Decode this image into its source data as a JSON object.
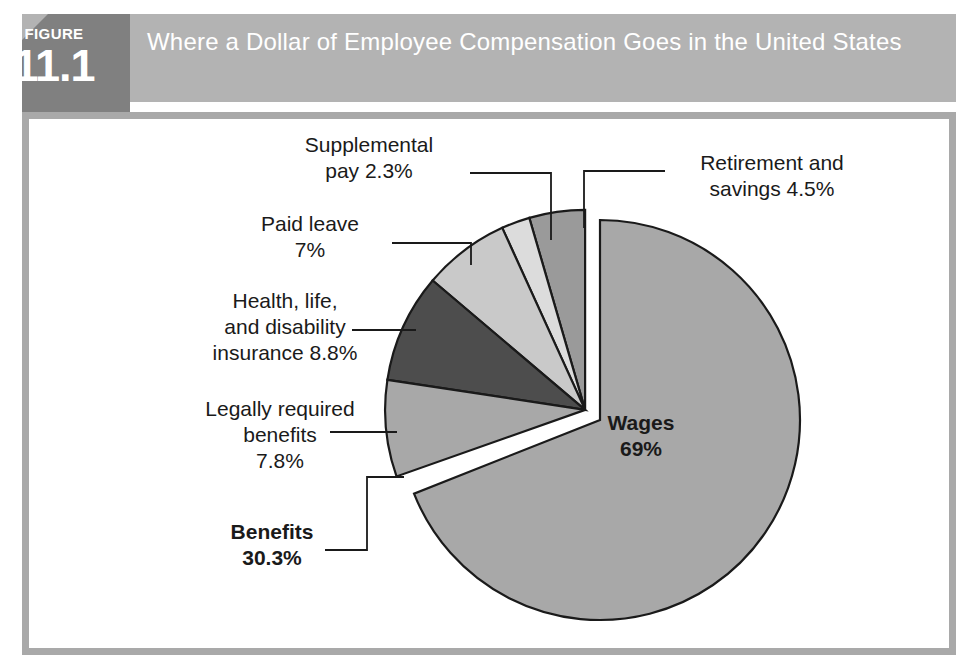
{
  "figure": {
    "badge_word": "FIGURE",
    "badge_number": "11.1",
    "title": "Where a Dollar of Employee Compensation Goes in the United States"
  },
  "colors": {
    "badge_bg": "#808080",
    "header_bg": "#b3b3b3",
    "frame_border": "#a9a9a9",
    "page_bg": "#ffffff",
    "wedge_outline": "#1a1a1a",
    "label_text": "#1a1a1a",
    "wages": "#a8a8a8",
    "legally_required": "#a8a8a8",
    "health_life_disability": "#4d4d4d",
    "paid_leave": "#c9c9c9",
    "supplemental_pay": "#dcdcdc",
    "retirement_savings": "#9a9a9a"
  },
  "chart_data": {
    "type": "pie",
    "title": "Where a Dollar of Employee Compensation Goes in the United States",
    "xlabel": "",
    "ylabel": "",
    "grid": false,
    "legend": "none",
    "units": "percent",
    "start_angle_deg": 0,
    "direction": "clockwise",
    "exploded_group": "Benefits",
    "slices": [
      {
        "name": "Wages",
        "value": 69,
        "label": "Wages\n69%",
        "label_position": "inside",
        "color": "#a8a8a8",
        "exploded": false,
        "bold": true
      },
      {
        "name": "Retirement and savings",
        "value": 4.5,
        "label": "Retirement and\nsavings  4.5%",
        "label_position": "outside-right",
        "color": "#9a9a9a",
        "exploded": true,
        "bold": false
      },
      {
        "name": "Supplemental pay",
        "value": 2.3,
        "label": "Supplemental\npay 2.3%",
        "label_position": "outside-top",
        "color": "#dcdcdc",
        "exploded": true,
        "bold": false
      },
      {
        "name": "Paid leave",
        "value": 7,
        "label": "Paid leave\n7%",
        "label_position": "outside-left",
        "color": "#c9c9c9",
        "exploded": true,
        "bold": false
      },
      {
        "name": "Health, life, and disability insurance",
        "value": 8.8,
        "label": "Health, life,\nand disability\ninsurance  8.8%",
        "label_position": "outside-left",
        "color": "#4d4d4d",
        "exploded": true,
        "bold": false
      },
      {
        "name": "Legally required benefits",
        "value": 7.8,
        "label": "Legally required\nbenefits\n7.8%",
        "label_position": "outside-left",
        "color": "#a8a8a8",
        "exploded": true,
        "bold": false
      }
    ],
    "groups": [
      {
        "name": "Benefits",
        "value": 30.3,
        "label": "Benefits\n30.3%",
        "label_position": "outside-bottom-left",
        "bold": true,
        "members": [
          "Retirement and savings",
          "Supplemental pay",
          "Paid leave",
          "Health, life, and disability insurance",
          "Legally required benefits"
        ]
      }
    ]
  },
  "labels": {
    "supplemental": "Supplemental\npay 2.3%",
    "retirement": "Retirement and\nsavings  4.5%",
    "paid_leave": "Paid leave\n7%",
    "health": "Health, life,\nand disability\ninsurance  8.8%",
    "legally_required": "Legally required\nbenefits\n7.8%",
    "benefits": "Benefits\n30.3%",
    "wages": "Wages\n69%"
  }
}
